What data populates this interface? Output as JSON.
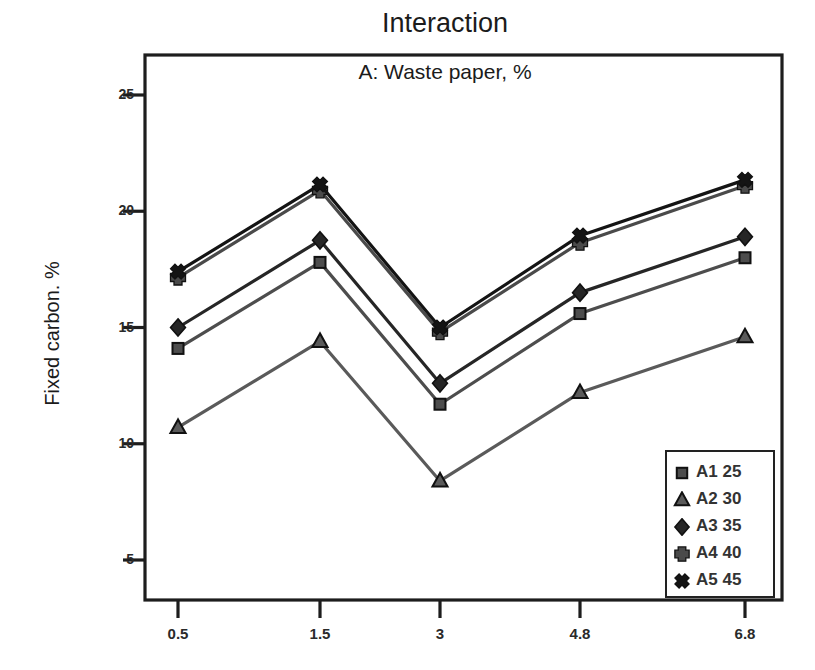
{
  "chart_data": {
    "type": "line",
    "title": "Interaction",
    "subtitle": "A: Waste paper, %",
    "xlabel": "",
    "ylabel": "Fixed carbon. %",
    "categories": [
      "0.5",
      "1.5",
      "3",
      "4.8",
      "6.8"
    ],
    "x_tick_labels": [
      "0.5",
      "1.5",
      "3",
      "4.8",
      "6.8"
    ],
    "y_tick_labels": [
      "5",
      "10",
      "15",
      "20",
      "25"
    ],
    "y_ticks": [
      5,
      10,
      15,
      20,
      25
    ],
    "ylim": [
      3.2,
      26.5
    ],
    "grid": false,
    "legend_position": "bottom-right",
    "series": [
      {
        "name": "A1 25",
        "marker": "square",
        "color": "#4d4d4d",
        "values": [
          14.1,
          17.8,
          11.7,
          15.6,
          18.0
        ]
      },
      {
        "name": "A2 30",
        "marker": "triangle",
        "color": "#5a5a5a",
        "values": [
          10.7,
          14.4,
          8.4,
          12.2,
          14.6
        ]
      },
      {
        "name": "A3 35",
        "marker": "diamond",
        "color": "#262626",
        "values": [
          15.0,
          18.75,
          12.6,
          16.5,
          18.9
        ]
      },
      {
        "name": "A4 40",
        "marker": "plus",
        "color": "#4a4a4a",
        "values": [
          17.15,
          20.9,
          14.8,
          18.65,
          21.1
        ]
      },
      {
        "name": "A5 45",
        "marker": "cross",
        "color": "#141414",
        "values": [
          17.4,
          21.15,
          15.0,
          18.95,
          21.35
        ]
      }
    ]
  },
  "axes": {
    "y_title": "Fixed carbon. %"
  },
  "legend": {
    "entries": [
      {
        "label": "A1 25",
        "marker": "square-marker"
      },
      {
        "label": "A2 30",
        "marker": "triangle-marker"
      },
      {
        "label": "A3 35",
        "marker": "diamond-marker"
      },
      {
        "label": "A4 40",
        "marker": "plus-marker"
      },
      {
        "label": "A5 45",
        "marker": "cross-marker"
      }
    ]
  }
}
